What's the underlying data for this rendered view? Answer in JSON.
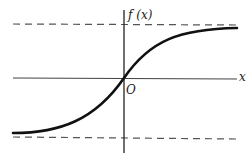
{
  "figure": {
    "y_axis_label": "f (x)",
    "x_axis_label": "x",
    "origin_label": "O",
    "curve": "sigmoid-like increasing curve passing through origin",
    "asymptotes": [
      "upper horizontal dashed asymptote",
      "lower horizontal dashed asymptote"
    ],
    "colors": {
      "curve": "#111111",
      "axes": "#333333",
      "dashed": "#555555",
      "background": "#ffffff"
    }
  }
}
